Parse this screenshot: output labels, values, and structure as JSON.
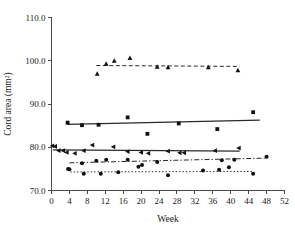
{
  "chart_data": {
    "type": "scatter",
    "title": "",
    "xlabel": "Week",
    "ylabel": "Cord area (mm2)",
    "ylabel_display": "Cord area (mm²)",
    "xlim": [
      0,
      52
    ],
    "ylim": [
      70.0,
      110.0
    ],
    "xticks": [
      0,
      4,
      8,
      12,
      16,
      20,
      24,
      28,
      32,
      36,
      40,
      44,
      48,
      52
    ],
    "xticklabels": [
      "0",
      "4",
      "8",
      "12",
      "16",
      "20",
      "24",
      "28",
      "32",
      "36",
      "40",
      "44",
      "48",
      "52"
    ],
    "yticks": [
      70.0,
      80.0,
      90.0,
      100.0,
      110.0
    ],
    "yticklabels": [
      "70.0",
      "80.0",
      "90.0",
      "100.0",
      "110.0"
    ],
    "grid": false,
    "legend": "none",
    "series": [
      {
        "name": "triangle-up-series",
        "marker": "triangle-up",
        "linestyle": "dashed",
        "points": [
          {
            "x": 10.2,
            "y": 97.0
          },
          {
            "x": 12.2,
            "y": 99.3
          },
          {
            "x": 14.0,
            "y": 100.0
          },
          {
            "x": 17.5,
            "y": 100.6
          },
          {
            "x": 23.6,
            "y": 98.6
          },
          {
            "x": 26.0,
            "y": 98.5
          },
          {
            "x": 35.0,
            "y": 98.5
          },
          {
            "x": 41.6,
            "y": 97.8
          }
        ],
        "fit": {
          "x0": 10.0,
          "y0": 98.9,
          "x1": 42.0,
          "y1": 98.7
        }
      },
      {
        "name": "square-series",
        "marker": "square",
        "linestyle": "solid",
        "points": [
          {
            "x": 3.6,
            "y": 85.7
          },
          {
            "x": 6.8,
            "y": 85.1
          },
          {
            "x": 10.5,
            "y": 85.2
          },
          {
            "x": 17.0,
            "y": 86.9
          },
          {
            "x": 21.4,
            "y": 83.1
          },
          {
            "x": 28.4,
            "y": 85.5
          },
          {
            "x": 37.0,
            "y": 84.2
          },
          {
            "x": 45.0,
            "y": 88.1
          }
        ],
        "fit": {
          "x0": 3.5,
          "y0": 85.3,
          "x1": 46.5,
          "y1": 86.3
        }
      },
      {
        "name": "triangle-left-series",
        "marker": "triangle-left",
        "linestyle": "solid",
        "points": [
          {
            "x": 0.2,
            "y": 80.3
          },
          {
            "x": 0.8,
            "y": 80.2
          },
          {
            "x": 1.6,
            "y": 79.2
          },
          {
            "x": 2.6,
            "y": 79.2
          },
          {
            "x": 3.4,
            "y": 78.8
          },
          {
            "x": 5.2,
            "y": 78.6
          },
          {
            "x": 7.2,
            "y": 79.2
          },
          {
            "x": 9.1,
            "y": 80.5
          },
          {
            "x": 13.8,
            "y": 80.1
          },
          {
            "x": 17.0,
            "y": 79.0
          },
          {
            "x": 20.0,
            "y": 78.8
          },
          {
            "x": 21.6,
            "y": 78.6
          },
          {
            "x": 26.0,
            "y": 79.1
          },
          {
            "x": 28.6,
            "y": 78.7
          },
          {
            "x": 29.6,
            "y": 78.7
          },
          {
            "x": 36.5,
            "y": 79.2
          },
          {
            "x": 41.8,
            "y": 79.8
          }
        ],
        "fit": {
          "x0": 0.3,
          "y0": 79.4,
          "x1": 42.0,
          "y1": 79.1
        }
      },
      {
        "name": "circle-upper-series",
        "marker": "circle",
        "linestyle": "dash-dot",
        "points": [
          {
            "x": 3.7,
            "y": 75.0
          },
          {
            "x": 6.8,
            "y": 76.3
          },
          {
            "x": 10.0,
            "y": 76.9
          },
          {
            "x": 12.2,
            "y": 77.1
          },
          {
            "x": 17.0,
            "y": 77.1
          },
          {
            "x": 20.2,
            "y": 75.9
          },
          {
            "x": 23.6,
            "y": 76.6
          },
          {
            "x": 38.0,
            "y": 77.0
          },
          {
            "x": 40.8,
            "y": 77.1
          },
          {
            "x": 48.0,
            "y": 77.8
          }
        ],
        "fit": {
          "x0": 4.0,
          "y0": 76.4,
          "x1": 48.2,
          "y1": 77.5
        }
      },
      {
        "name": "circle-lower-series",
        "marker": "circle",
        "linestyle": "dotted",
        "points": [
          {
            "x": 4.0,
            "y": 74.9
          },
          {
            "x": 7.2,
            "y": 73.9
          },
          {
            "x": 11.0,
            "y": 73.9
          },
          {
            "x": 14.9,
            "y": 74.2
          },
          {
            "x": 19.4,
            "y": 75.5
          },
          {
            "x": 26.0,
            "y": 73.5
          },
          {
            "x": 33.8,
            "y": 74.6
          },
          {
            "x": 37.4,
            "y": 74.8
          },
          {
            "x": 39.6,
            "y": 75.4
          },
          {
            "x": 45.0,
            "y": 73.9
          }
        ],
        "fit": {
          "x0": 4.2,
          "y0": 74.3,
          "x1": 45.2,
          "y1": 74.4
        }
      }
    ]
  },
  "axes": {
    "y_title": "Cord area (mm²)",
    "x_title": "Week"
  }
}
